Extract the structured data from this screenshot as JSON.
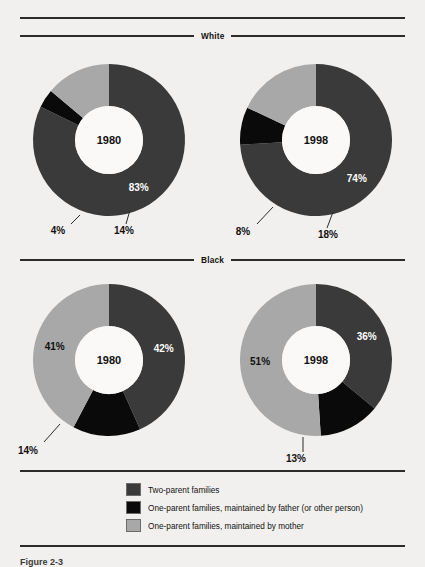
{
  "page": {
    "background": "#f2f0ee",
    "caption": "Figure 2-3"
  },
  "sections": [
    {
      "title": "White"
    },
    {
      "title": "Black"
    }
  ],
  "legend": {
    "items": [
      {
        "label": "Two-parent families",
        "color": "#3a3a3a",
        "key": "two_parent"
      },
      {
        "label": "One-parent families, maintained by father (or other person)",
        "color": "#0a0a0a",
        "key": "father"
      },
      {
        "label": "One-parent families, maintained by mother",
        "color": "#a8a8a8",
        "key": "mother"
      }
    ]
  },
  "colors": {
    "two_parent": "#3a3a3a",
    "father": "#0a0a0a",
    "mother": "#a8a8a8",
    "rule": "#2b2b2b",
    "hole": "#faf9f7"
  },
  "chart_data": [
    {
      "type": "pie",
      "title": "White",
      "center_label": "1980",
      "categories": [
        "Two-parent families",
        "One-parent families, maintained by father (or other person)",
        "One-parent families, maintained by mother"
      ],
      "values": [
        83,
        4,
        14
      ],
      "labels": [
        "83%",
        "4%",
        "14%"
      ],
      "unit": "%"
    },
    {
      "type": "pie",
      "title": "White",
      "center_label": "1998",
      "categories": [
        "Two-parent families",
        "One-parent families, maintained by father (or other person)",
        "One-parent families, maintained by mother"
      ],
      "values": [
        74,
        8,
        18
      ],
      "labels": [
        "74%",
        "8%",
        "18%"
      ],
      "unit": "%"
    },
    {
      "type": "pie",
      "title": "Black",
      "center_label": "1980",
      "categories": [
        "Two-parent families",
        "One-parent families, maintained by father (or other person)",
        "One-parent families, maintained by mother"
      ],
      "values": [
        42,
        14,
        41
      ],
      "labels": [
        "42%",
        "14%",
        "41%"
      ],
      "unit": "%"
    },
    {
      "type": "pie",
      "title": "Black",
      "center_label": "1998",
      "categories": [
        "Two-parent families",
        "One-parent families, maintained by father (or other person)",
        "One-parent families, maintained by mother"
      ],
      "values": [
        36,
        13,
        51
      ],
      "labels": [
        "36%",
        "13%",
        "51%"
      ],
      "unit": "%"
    }
  ]
}
